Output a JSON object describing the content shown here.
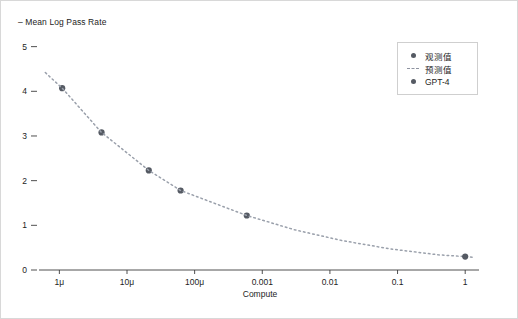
{
  "chart_data": {
    "type": "scatter",
    "title": "",
    "xlabel": "Compute",
    "ylabel": "Mean Log Pass Rate",
    "ylabel_display": "– Mean Log Pass Rate",
    "xscale": "log",
    "yscale": "linear",
    "xlim": [
      5e-07,
      1.6
    ],
    "ylim": [
      0,
      5.35
    ],
    "grid": false,
    "legend_position": "top-right",
    "xticks": [
      {
        "value": 1e-06,
        "label": "1μ"
      },
      {
        "value": 1e-05,
        "label": "10μ"
      },
      {
        "value": 0.0001,
        "label": "100μ"
      },
      {
        "value": 0.001,
        "label": "0.001"
      },
      {
        "value": 0.01,
        "label": "0.01"
      },
      {
        "value": 0.1,
        "label": "0.1"
      },
      {
        "value": 1,
        "label": "1"
      }
    ],
    "yticks": [
      {
        "value": 0,
        "label": "0"
      },
      {
        "value": 1,
        "label": "1"
      },
      {
        "value": 2,
        "label": "2"
      },
      {
        "value": 3,
        "label": "3"
      },
      {
        "value": 4,
        "label": "4"
      },
      {
        "value": 5,
        "label": "5"
      }
    ],
    "series": [
      {
        "name": "观测值",
        "type": "scatter",
        "marker": "circle",
        "color": "#555a63",
        "points": [
          {
            "x": 1.1e-06,
            "y": 4.07
          },
          {
            "x": 4.2e-06,
            "y": 3.08
          },
          {
            "x": 2.1e-05,
            "y": 2.23
          },
          {
            "x": 6.2e-05,
            "y": 1.78
          },
          {
            "x": 0.00059,
            "y": 1.22
          }
        ]
      },
      {
        "name": "预测值",
        "type": "line",
        "linestyle": "dotted",
        "color": "#9aa0ab",
        "points": [
          {
            "x": 6.2e-07,
            "y": 4.42
          },
          {
            "x": 1.1e-06,
            "y": 4.07
          },
          {
            "x": 4.2e-06,
            "y": 3.08
          },
          {
            "x": 2.1e-05,
            "y": 2.23
          },
          {
            "x": 6.2e-05,
            "y": 1.78
          },
          {
            "x": 0.00059,
            "y": 1.22
          },
          {
            "x": 0.003,
            "y": 0.9
          },
          {
            "x": 0.015,
            "y": 0.66
          },
          {
            "x": 0.08,
            "y": 0.47
          },
          {
            "x": 0.4,
            "y": 0.34
          },
          {
            "x": 1.0,
            "y": 0.3
          },
          {
            "x": 1.4,
            "y": 0.28
          }
        ]
      },
      {
        "name": "GPT-4",
        "type": "scatter",
        "marker": "circle",
        "color": "#555a63",
        "points": [
          {
            "x": 1.0,
            "y": 0.3
          }
        ]
      }
    ],
    "legend": [
      {
        "label": "观测值",
        "key": "dot",
        "color": "#555a63"
      },
      {
        "label": "预测值",
        "key": "dash",
        "color": "#8e93a0"
      },
      {
        "label": "GPT-4",
        "key": "dot",
        "color": "#555a63"
      }
    ],
    "colors": {
      "observed_marker": "#555a63",
      "predicted_line": "#9aa0ab",
      "gpt4_marker": "#555a63",
      "axis": "#3c3c3c",
      "text": "#1d1d1d",
      "frame": "#d8d8d8",
      "background": "#ffffff"
    }
  }
}
